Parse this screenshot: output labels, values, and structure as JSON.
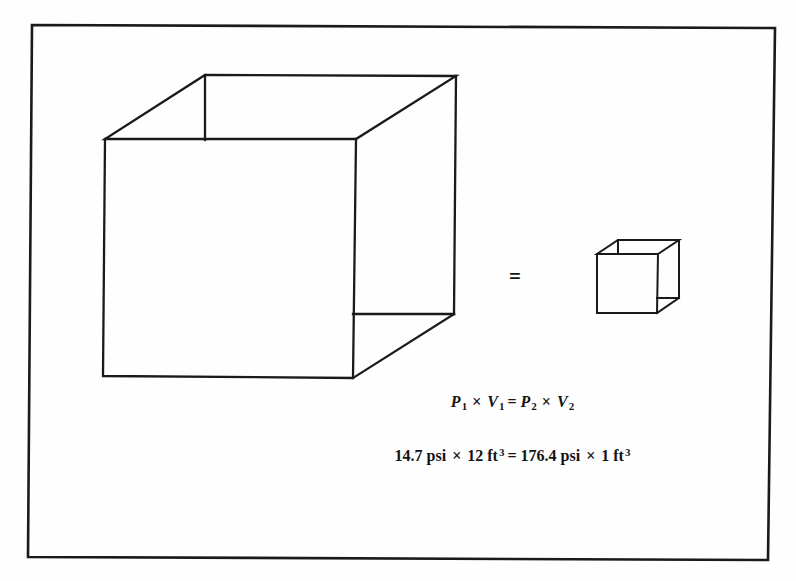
{
  "diagram": {
    "equals_between_cubes": "=",
    "symbolic_equation": {
      "p1": "P",
      "p1_sub": "1",
      "times1": "×",
      "v1": "V",
      "v1_sub": "1",
      "equals": "=",
      "p2": "P",
      "p2_sub": "2",
      "times2": "×",
      "v2": "V",
      "v2_sub": "2"
    },
    "numeric_equation": {
      "lhs_pressure": "14.7 psi",
      "times1": "×",
      "lhs_volume": "12 ft",
      "lhs_exponent": "3",
      "equals": "=",
      "rhs_pressure": "176.4 psi",
      "times2": "×",
      "rhs_volume": "1 ft",
      "rhs_exponent": "3"
    },
    "colors": {
      "line": "#1a1a1a",
      "background": "#fefefe",
      "text": "#141414"
    }
  }
}
